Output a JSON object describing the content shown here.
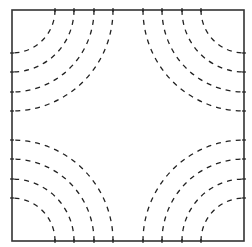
{
  "diagram": {
    "type": "contour-arcs",
    "box": {
      "x": 12,
      "y": 10,
      "width": 232,
      "height": 231
    },
    "colors": {
      "line": "#222222",
      "background": "#ffffff",
      "frame": "#333333"
    },
    "arc_radii": [
      43,
      62,
      82,
      101
    ],
    "corners": [
      "top-left",
      "top-right",
      "bottom-left",
      "bottom-right"
    ],
    "dash": "5,5",
    "tick_length": 4
  }
}
